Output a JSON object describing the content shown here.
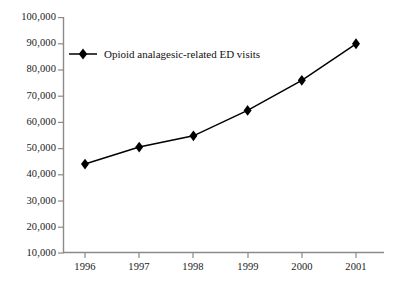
{
  "chart_data": {
    "type": "line",
    "title": "",
    "subtitle": "",
    "xlabel": "",
    "ylabel": "",
    "categories": [
      "1996",
      "1997",
      "1998",
      "1999",
      "2000",
      "2001"
    ],
    "x": [
      1996,
      1997,
      1998,
      1999,
      2000,
      2001
    ],
    "series": [
      {
        "name": "Opioid analagesic-related ED visits",
        "values": [
          44000,
          50500,
          54800,
          64500,
          76000,
          90000
        ],
        "marker": "diamond",
        "color": "#000000"
      }
    ],
    "ylim": [
      10000,
      100000
    ],
    "ytick_values": [
      10000,
      20000,
      30000,
      40000,
      50000,
      60000,
      70000,
      80000,
      90000,
      100000
    ],
    "ytick_labels": [
      "10,000",
      "20,000",
      "30,000",
      "40,000",
      "50,000",
      "60,000",
      "70,000",
      "80,000",
      "90,000",
      "100,000"
    ],
    "xtick_labels": [
      "1996",
      "1997",
      "1998",
      "1999",
      "2000",
      "2001"
    ],
    "grid": false,
    "legend_position": "inside-top-left",
    "legend_entries": [
      "Opioid analagesic-related ED visits"
    ],
    "annotations": []
  },
  "legend": {
    "label": "Opioid analagesic-related ED visits",
    "marker_icon": "diamond-marker-icon"
  },
  "axes": {
    "axis_color": "#808080",
    "line_color": "#000000",
    "marker_color": "#000000",
    "background": "#ffffff"
  }
}
